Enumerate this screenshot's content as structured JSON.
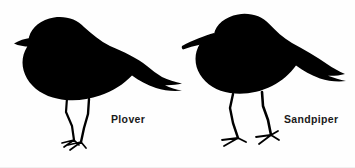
{
  "figure": {
    "kind": "bird-silhouette-comparison",
    "background_color": "#fefefe",
    "silhouette_color": "#000000",
    "label_color": "#1a1a1a",
    "width": 355,
    "height": 168
  },
  "birds": [
    {
      "id": "plover",
      "label": "Plover",
      "position": "left",
      "bill": "short stubby bill",
      "body": "plump rounded body",
      "legs": "short thin legs",
      "tail": "pointed notched tail"
    },
    {
      "id": "sandpiper",
      "label": "Sandpiper",
      "position": "right",
      "bill": "long pointed downcurved bill",
      "body": "elongated horizontal body",
      "legs": "long bent legs",
      "tail": "pointed notched tail"
    }
  ]
}
